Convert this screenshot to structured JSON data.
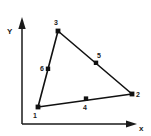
{
  "figure": {
    "kind": "finite-element-triangle-diagram",
    "background_color": "#ffffff",
    "ink_color": "#111111"
  },
  "axes": {
    "x": {
      "label": "x",
      "label_pos": {
        "x": 140,
        "y": 130
      },
      "start": {
        "x": 22,
        "y": 124
      },
      "end": {
        "x": 136,
        "y": 124
      },
      "arrow": "right"
    },
    "y": {
      "label": "Y",
      "label_pos": {
        "x": 7,
        "y": 34
      },
      "start": {
        "x": 22,
        "y": 124
      },
      "end": {
        "x": 22,
        "y": 20
      },
      "arrow": "up"
    }
  },
  "element": {
    "type": "6-node quadratic triangle",
    "corner_nodes": [
      {
        "id": "1",
        "x": 38,
        "y": 107,
        "label": "1",
        "label_x": 34,
        "label_y": 117
      },
      {
        "id": "2",
        "x": 132,
        "y": 94,
        "label": "2",
        "label_x": 136,
        "label_y": 95
      },
      {
        "id": "3",
        "x": 58,
        "y": 31,
        "label": "3",
        "label_x": 55,
        "label_y": 25
      }
    ],
    "midside_nodes": [
      {
        "id": "4",
        "x": 86,
        "y": 99,
        "label": "4",
        "label_x": 84,
        "label_y": 110,
        "edge": "1-2"
      },
      {
        "id": "5",
        "x": 96,
        "y": 63,
        "label": "5",
        "label_x": 98,
        "label_y": 58,
        "edge": "2-3"
      },
      {
        "id": "6",
        "x": 48,
        "y": 69,
        "label": "6",
        "label_x": 42,
        "label_y": 69,
        "edge": "3-1"
      }
    ],
    "edges": [
      {
        "name": "edge-1-2",
        "from": "1",
        "to": "2"
      },
      {
        "name": "edge-2-3",
        "from": "2",
        "to": "3"
      },
      {
        "name": "edge-3-1",
        "from": "3",
        "to": "1"
      }
    ]
  }
}
